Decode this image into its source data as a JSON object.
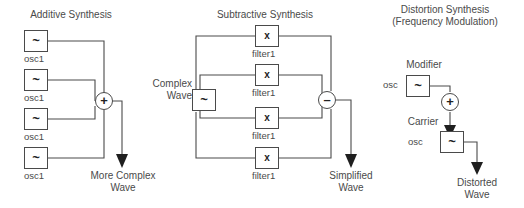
{
  "diagram": {
    "title_additive": "Additive Synthesis",
    "title_subtractive": "Subtractive Synthesis",
    "title_distortion_line1": "Distortion Synthesis",
    "title_distortion_line2": "(Frequency Modulation)"
  },
  "additive": {
    "oscillators": [
      {
        "glyph": "~",
        "label": "osc1"
      },
      {
        "glyph": "~",
        "label": "osc1"
      },
      {
        "glyph": "~",
        "label": "osc1"
      },
      {
        "glyph": "~",
        "label": "osc1"
      }
    ],
    "mixer": {
      "glyph": "+",
      "name": "sum-node"
    },
    "output_label": "More Complex\nWave"
  },
  "subtractive": {
    "source": {
      "glyph": "~",
      "label": "Complex\nWave"
    },
    "filters": [
      {
        "glyph": "x",
        "label": "filter1"
      },
      {
        "glyph": "x",
        "label": "filter1"
      },
      {
        "glyph": "x",
        "label": "filter1"
      },
      {
        "glyph": "x",
        "label": "filter1"
      }
    ],
    "mixer": {
      "glyph": "–",
      "name": "difference-node"
    },
    "output_label": "Simplified\nWave"
  },
  "distortion": {
    "modifier": {
      "glyph": "~",
      "title": "Modifier",
      "label": "osc"
    },
    "mixer": {
      "glyph": "+",
      "name": "sum-node"
    },
    "carrier": {
      "glyph": "~",
      "title": "Carrier",
      "label": "osc"
    },
    "output_label": "Distorted\nWave"
  },
  "colors": {
    "stroke": "#4a4a4a",
    "text": "#4a4a4a",
    "background": "#ffffff"
  }
}
